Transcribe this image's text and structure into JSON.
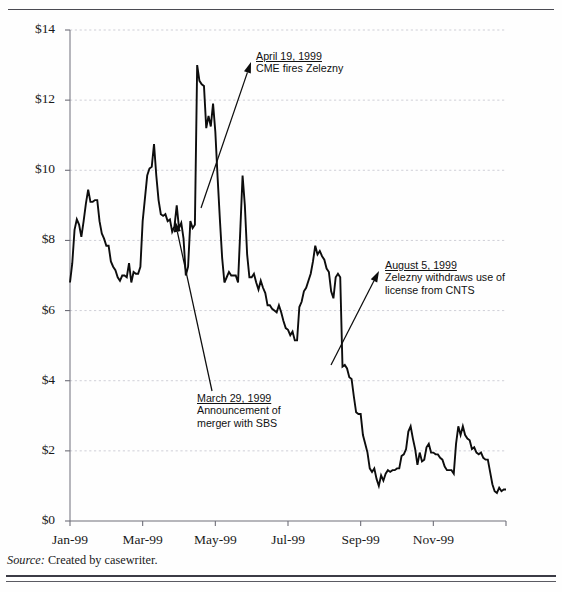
{
  "exhibit": {
    "source_label": "Source:",
    "source_text": "Created by casewriter."
  },
  "chart_data": {
    "type": "line",
    "title": "",
    "subtitle": "",
    "xlabel": "",
    "ylabel": "",
    "grid": true,
    "legend": "none",
    "ylim": [
      0,
      14
    ],
    "ytick_labels": [
      "$0",
      "$2",
      "$4",
      "$6",
      "$8",
      "$10",
      "$12",
      "$14"
    ],
    "ytick_values": [
      0,
      2,
      4,
      6,
      8,
      10,
      12,
      14
    ],
    "xtick_labels": [
      "Jan-99",
      "Mar-99",
      "May-99",
      "Jul-99",
      "Sep-99",
      "Nov-99"
    ],
    "xtick_positions": [
      0,
      2,
      4,
      6,
      8,
      10
    ],
    "xlim": [
      0,
      12
    ],
    "series": [
      {
        "name": "Share price",
        "values": [
          6.8,
          7.35,
          8.3,
          8.6,
          8.45,
          8.1,
          8.55,
          9.05,
          9.45,
          9.1,
          9.1,
          9.15,
          9.15,
          8.55,
          8.2,
          8.05,
          7.85,
          7.85,
          7.4,
          7.25,
          7.15,
          6.95,
          6.85,
          7.0,
          7.0,
          6.95,
          7.35,
          6.8,
          7.1,
          7.05,
          7.05,
          7.25,
          8.55,
          9.2,
          9.85,
          10.05,
          10.1,
          10.75,
          9.85,
          9.15,
          8.75,
          8.7,
          8.75,
          8.55,
          8.6,
          8.25,
          8.4,
          9.0,
          8.35,
          8.5,
          8.05,
          7.0,
          7.25,
          8.55,
          8.35,
          8.45,
          13.0,
          12.55,
          12.45,
          12.4,
          11.2,
          11.55,
          11.25,
          11.9,
          11.1,
          9.8,
          8.6,
          7.5,
          6.8,
          6.95,
          7.1,
          7.0,
          7.0,
          7.0,
          6.8,
          8.3,
          9.85,
          9.0,
          7.6,
          6.95,
          6.95,
          7.05,
          6.8,
          6.6,
          6.85,
          6.65,
          6.5,
          6.15,
          6.15,
          6.05,
          6.0,
          5.95,
          6.15,
          5.95,
          5.7,
          5.5,
          5.45,
          5.3,
          5.4,
          5.15,
          5.15,
          6.1,
          6.25,
          6.55,
          6.65,
          6.85,
          7.05,
          7.4,
          7.85,
          7.6,
          7.7,
          7.55,
          7.45,
          7.2,
          7.1,
          6.55,
          6.35,
          6.95,
          7.05,
          6.95,
          4.4,
          4.45,
          4.35,
          4.1,
          4.05,
          3.55,
          3.1,
          3.05,
          3.05,
          2.45,
          2.2,
          1.95,
          1.5,
          1.4,
          1.5,
          1.2,
          1.0,
          1.3,
          1.15,
          1.35,
          1.45,
          1.4,
          1.45,
          1.45,
          1.5,
          1.5,
          1.85,
          1.9,
          2.05,
          2.55,
          2.7,
          2.35,
          2.05,
          1.6,
          1.95,
          1.7,
          1.75,
          2.1,
          2.2,
          1.95,
          1.95,
          1.9,
          1.9,
          1.8,
          1.75,
          1.55,
          1.45,
          1.45,
          1.45,
          1.35,
          2.2,
          2.7,
          2.45,
          2.7,
          2.45,
          2.35,
          2.3,
          2.05,
          2.1,
          1.95,
          1.9,
          1.95,
          1.8,
          1.75,
          1.75,
          1.4,
          1.05,
          0.85,
          0.8,
          0.95,
          0.85,
          0.9,
          0.9
        ]
      }
    ],
    "annotations": [
      {
        "id": "april-19",
        "date": "April 19, 1999",
        "lines": [
          "CME fires Zelezny"
        ],
        "label_x": 256,
        "label_y": 50,
        "arrow_from_x": 201,
        "arrow_from_y": 208,
        "arrow_to_x": 251,
        "arrow_to_y": 62
      },
      {
        "id": "march-29",
        "date": "March 29, 1999",
        "lines": [
          "Announcement of",
          "merger with SBS"
        ],
        "label_x": 197,
        "label_y": 392,
        "arrow_from_x": 212,
        "arrow_from_y": 391,
        "arrow_to_x": 175,
        "arrow_to_y": 221
      },
      {
        "id": "august-5",
        "date": "August 5, 1999",
        "lines": [
          "Zelezny withdraws use of",
          "license from CNTS"
        ],
        "label_x": 385,
        "label_y": 259,
        "arrow_from_x": 331,
        "arrow_from_y": 365,
        "arrow_to_x": 379,
        "arrow_to_y": 271
      }
    ]
  }
}
